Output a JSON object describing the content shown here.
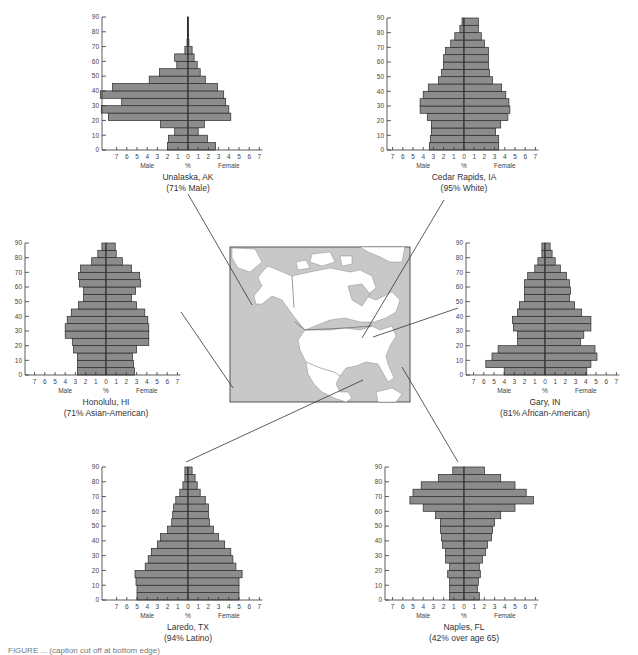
{
  "figure": {
    "caption_partial": "FIGURE ... (caption cut off at bottom edge)"
  },
  "map": {
    "label": "North America map",
    "land_color": "#ffffff",
    "water_color": "#c8c8c8",
    "border_color": "#555555"
  },
  "colors": {
    "bar_fill": "#8c8c8c",
    "bar_stroke": "#2a2a2a",
    "axis": "#333333"
  },
  "chart_data": [
    {
      "type": "bar",
      "orientation": "horizontal-population-pyramid",
      "title": "Unalaska, AK",
      "subtitle": "(71% Male)",
      "xlabel": "%",
      "xlabel_left": "Male",
      "xlabel_right": "Female",
      "x_ticks": [
        7,
        6,
        5,
        4,
        3,
        2,
        1,
        0,
        1,
        2,
        3,
        4,
        5,
        6,
        7
      ],
      "y_ticks": [
        0,
        10,
        20,
        30,
        40,
        50,
        60,
        70,
        80,
        90
      ],
      "age_groups": [
        "0-4",
        "5-9",
        "10-14",
        "15-19",
        "20-24",
        "25-29",
        "30-34",
        "35-39",
        "40-44",
        "45-49",
        "50-54",
        "55-59",
        "60-64",
        "65-69",
        "70-74",
        "75-79",
        "80-84",
        "85-89"
      ],
      "series": [
        {
          "name": "Male",
          "values": [
            2.0,
            1.9,
            1.3,
            2.7,
            7.8,
            8.5,
            6.5,
            8.6,
            7.4,
            3.8,
            2.8,
            1.1,
            1.3,
            0.3,
            0.1,
            0.05,
            0.05,
            0.05
          ]
        },
        {
          "name": "Female",
          "values": [
            2.7,
            1.9,
            1.0,
            1.6,
            4.2,
            4.0,
            3.7,
            3.5,
            2.9,
            1.7,
            1.2,
            0.9,
            0.6,
            0.4,
            0.1,
            0.05,
            0.05,
            0.05
          ]
        }
      ]
    },
    {
      "type": "bar",
      "orientation": "horizontal-population-pyramid",
      "title": "Cedar Rapids, IA",
      "subtitle": "(95% White)",
      "xlabel": "%",
      "xlabel_left": "Male",
      "xlabel_right": "Female",
      "x_ticks": [
        7,
        6,
        5,
        4,
        3,
        2,
        1,
        0,
        1,
        2,
        3,
        4,
        5,
        6,
        7
      ],
      "y_ticks": [
        0,
        10,
        20,
        30,
        40,
        50,
        60,
        70,
        80,
        90
      ],
      "age_groups": [
        "0-4",
        "5-9",
        "10-14",
        "15-19",
        "20-24",
        "25-29",
        "30-34",
        "35-39",
        "40-44",
        "45-49",
        "50-54",
        "55-59",
        "60-64",
        "65-69",
        "70-74",
        "75-79",
        "80-84",
        "85-89"
      ],
      "series": [
        {
          "name": "Male",
          "values": [
            3.4,
            3.3,
            3.2,
            3.2,
            3.6,
            4.3,
            4.3,
            4.0,
            3.5,
            2.5,
            2.2,
            2.0,
            2.0,
            1.8,
            1.3,
            0.9,
            0.4,
            0.2
          ]
        },
        {
          "name": "Female",
          "values": [
            3.4,
            3.4,
            3.1,
            3.6,
            4.3,
            4.5,
            4.4,
            4.1,
            3.7,
            2.8,
            2.5,
            2.4,
            2.4,
            2.4,
            2.0,
            1.7,
            1.4,
            1.4
          ]
        }
      ]
    },
    {
      "type": "bar",
      "orientation": "horizontal-population-pyramid",
      "title": "Honolulu, HI",
      "subtitle": "(71% Asian-American)",
      "xlabel": "%",
      "xlabel_left": "Male",
      "xlabel_right": "Female",
      "x_ticks": [
        7,
        6,
        5,
        4,
        3,
        2,
        1,
        0,
        1,
        2,
        3,
        4,
        5,
        6,
        7
      ],
      "y_ticks": [
        0,
        10,
        20,
        30,
        40,
        50,
        60,
        70,
        80,
        90
      ],
      "age_groups": [
        "0-4",
        "5-9",
        "10-14",
        "15-19",
        "20-24",
        "25-29",
        "30-34",
        "35-39",
        "40-44",
        "45-49",
        "50-54",
        "55-59",
        "60-64",
        "65-69",
        "70-74",
        "75-79",
        "80-84",
        "85-89"
      ],
      "series": [
        {
          "name": "Male",
          "values": [
            2.8,
            2.8,
            2.8,
            3.2,
            3.3,
            4.0,
            4.0,
            3.8,
            3.4,
            2.7,
            2.2,
            2.2,
            2.6,
            2.7,
            2.5,
            1.4,
            0.8,
            0.4
          ]
        },
        {
          "name": "Female",
          "values": [
            2.8,
            2.7,
            2.6,
            3.0,
            4.2,
            4.2,
            4.2,
            4.1,
            3.8,
            3.0,
            2.5,
            2.9,
            3.4,
            3.3,
            2.5,
            1.6,
            1.0,
            0.9
          ]
        }
      ]
    },
    {
      "type": "bar",
      "orientation": "horizontal-population-pyramid",
      "title": "Gary, IN",
      "subtitle": "(81% African-American)",
      "xlabel": "%",
      "xlabel_left": "Male",
      "xlabel_right": "Female",
      "x_ticks": [
        7,
        6,
        5,
        4,
        3,
        2,
        1,
        0,
        1,
        2,
        3,
        4,
        5,
        6,
        7
      ],
      "y_ticks": [
        0,
        10,
        20,
        30,
        40,
        50,
        60,
        70,
        80,
        90
      ],
      "age_groups": [
        "0-4",
        "5-9",
        "10-14",
        "15-19",
        "20-24",
        "25-29",
        "30-34",
        "35-39",
        "40-44",
        "45-49",
        "50-54",
        "55-59",
        "60-64",
        "65-69",
        "70-74",
        "75-79",
        "80-84",
        "85-89"
      ],
      "series": [
        {
          "name": "Male",
          "values": [
            4.0,
            5.8,
            5.2,
            4.6,
            2.7,
            2.7,
            3.1,
            3.2,
            2.7,
            2.5,
            2.0,
            2.0,
            2.0,
            1.7,
            1.0,
            0.7,
            0.3,
            0.3
          ]
        },
        {
          "name": "Female",
          "values": [
            4.1,
            4.5,
            5.1,
            4.9,
            3.5,
            3.8,
            4.5,
            4.5,
            3.6,
            2.9,
            2.4,
            2.5,
            2.4,
            2.1,
            1.5,
            1.0,
            0.7,
            0.5
          ]
        }
      ]
    },
    {
      "type": "bar",
      "orientation": "horizontal-population-pyramid",
      "title": "Laredo, TX",
      "subtitle": "(94% Latino)",
      "xlabel": "%",
      "xlabel_left": "Male",
      "xlabel_right": "Female",
      "x_ticks": [
        7,
        6,
        5,
        4,
        3,
        2,
        1,
        0,
        1,
        2,
        3,
        4,
        5,
        6,
        7
      ],
      "y_ticks": [
        0,
        10,
        20,
        30,
        40,
        50,
        60,
        70,
        80,
        90
      ],
      "age_groups": [
        "0-4",
        "5-9",
        "10-14",
        "15-19",
        "20-24",
        "25-29",
        "30-34",
        "35-39",
        "40-44",
        "45-49",
        "50-54",
        "55-59",
        "60-64",
        "65-69",
        "70-74",
        "75-79",
        "80-84",
        "85-89"
      ],
      "series": [
        {
          "name": "Male",
          "values": [
            5.0,
            5.0,
            5.1,
            5.2,
            4.2,
            3.9,
            3.6,
            3.0,
            2.7,
            2.0,
            1.6,
            1.5,
            1.4,
            1.2,
            0.8,
            0.5,
            0.3,
            0.3
          ]
        },
        {
          "name": "Female",
          "values": [
            5.0,
            5.0,
            5.0,
            5.3,
            4.7,
            4.4,
            4.2,
            3.6,
            3.0,
            2.5,
            2.1,
            2.0,
            2.0,
            1.7,
            1.2,
            0.9,
            0.7,
            0.4
          ]
        }
      ]
    },
    {
      "type": "bar",
      "orientation": "horizontal-population-pyramid",
      "title": "Naples, FL",
      "subtitle": "(42% over age 65)",
      "xlabel": "%",
      "xlabel_left": "Male",
      "xlabel_right": "Female",
      "x_ticks": [
        7,
        6,
        5,
        4,
        3,
        2,
        1,
        0,
        1,
        2,
        3,
        4,
        5,
        6,
        7
      ],
      "y_ticks": [
        0,
        10,
        20,
        30,
        40,
        50,
        60,
        70,
        80,
        90
      ],
      "age_groups": [
        "0-4",
        "5-9",
        "10-14",
        "15-19",
        "20-24",
        "25-29",
        "30-34",
        "35-39",
        "40-44",
        "45-49",
        "50-54",
        "55-59",
        "60-64",
        "65-69",
        "70-74",
        "75-79",
        "80-84",
        "85-89"
      ],
      "series": [
        {
          "name": "Male",
          "values": [
            1.4,
            1.4,
            1.4,
            1.6,
            1.4,
            1.8,
            1.8,
            2.1,
            2.2,
            2.3,
            2.3,
            2.8,
            4.0,
            5.3,
            5.0,
            4.2,
            2.5,
            1.1
          ]
        },
        {
          "name": "Female",
          "values": [
            1.5,
            1.3,
            1.4,
            1.6,
            1.5,
            1.8,
            2.1,
            2.3,
            2.7,
            2.8,
            3.0,
            3.6,
            5.0,
            6.8,
            6.1,
            5.0,
            3.6,
            2.0
          ]
        }
      ]
    }
  ],
  "chart_layout": [
    {
      "zero_x": 188,
      "axis_x": 102,
      "top_y": 17,
      "bottom_y": 150,
      "unit": 10.2
    },
    {
      "zero_x": 464,
      "axis_x": 387,
      "top_y": 18,
      "bottom_y": 150,
      "unit": 10.2
    },
    {
      "zero_x": 106,
      "axis_x": 25,
      "top_y": 243,
      "bottom_y": 375,
      "unit": 10.2
    },
    {
      "zero_x": 545,
      "axis_x": 466,
      "top_y": 243,
      "bottom_y": 375,
      "unit": 10.2
    },
    {
      "zero_x": 188,
      "axis_x": 102,
      "top_y": 467,
      "bottom_y": 600,
      "unit": 10.2
    },
    {
      "zero_x": 464,
      "axis_x": 385,
      "top_y": 467,
      "bottom_y": 600,
      "unit": 10.2
    }
  ]
}
